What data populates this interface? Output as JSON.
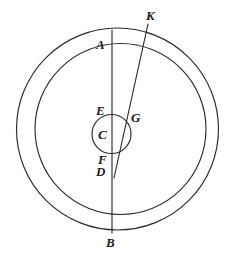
{
  "figure": {
    "background_color": "#ffffff",
    "stroke_color": "#2b2b2b",
    "label_color": "#1a1a1a",
    "width": 241,
    "height": 262
  },
  "chart_data": {
    "type": "diagram",
    "title": "",
    "shapes": [
      {
        "name": "outer-circle",
        "kind": "circle",
        "cx": 117.5,
        "cy": 129,
        "r": 101
      },
      {
        "name": "inner-circle",
        "kind": "circle",
        "cx": 120.5,
        "cy": 129,
        "r": 85.5
      },
      {
        "name": "small-circle",
        "kind": "circle",
        "cx": 111.5,
        "cy": 134,
        "r": 19.5
      },
      {
        "name": "segment-AB",
        "kind": "line",
        "x1": 112,
        "y1": 30,
        "x2": 112,
        "y2": 233
      },
      {
        "name": "segment-KD",
        "kind": "line",
        "x1": 148,
        "y1": 24,
        "x2": 114,
        "y2": 178
      }
    ],
    "points": [
      {
        "id": "K",
        "label": "K",
        "x": 148,
        "y": 24,
        "label_x": 146,
        "label_y": 9
      },
      {
        "id": "A",
        "label": "A",
        "x": 112,
        "y": 30,
        "label_x": 96,
        "label_y": 38
      },
      {
        "id": "E",
        "label": "E",
        "x": 112,
        "y": 115,
        "label_x": 96,
        "label_y": 104
      },
      {
        "id": "G",
        "label": "G",
        "x": 130,
        "y": 125,
        "label_x": 131,
        "label_y": 111
      },
      {
        "id": "C",
        "label": "C",
        "x": 111,
        "y": 134,
        "label_x": 98,
        "label_y": 128
      },
      {
        "id": "F",
        "label": "F",
        "x": 112,
        "y": 153,
        "label_x": 98,
        "label_y": 153
      },
      {
        "id": "D",
        "label": "D",
        "x": 114,
        "y": 178,
        "label_x": 96,
        "label_y": 165
      },
      {
        "id": "B",
        "label": "B",
        "x": 112,
        "y": 233,
        "label_x": 106,
        "label_y": 236
      }
    ],
    "xlabel": "",
    "ylabel": "",
    "grid": false,
    "legend": "none"
  }
}
